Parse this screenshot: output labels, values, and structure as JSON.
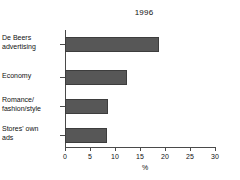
{
  "chart_data": {
    "type": "bar",
    "orientation": "horizontal",
    "title": "1996",
    "xlabel": "%",
    "ylabel": "",
    "xlim": [
      0,
      30
    ],
    "xticks": [
      0,
      5,
      10,
      15,
      20,
      25,
      30
    ],
    "xtick_labels": [
      "0",
      "5",
      "10",
      "15",
      "20",
      "25",
      "30"
    ],
    "grid": false,
    "legend": null,
    "categories": [
      "De Beers\nadvertising",
      "Economy",
      "Romance/\nfashion/style",
      "Stores' own\nads"
    ],
    "values": [
      18.7,
      12.3,
      8.5,
      8.4
    ],
    "series": [
      {
        "name": "1996",
        "values": [
          18.7,
          12.3,
          8.5,
          8.4
        ]
      }
    ],
    "bar_color": "#575757",
    "bar_edge_color": "#3d3d3d",
    "axis_color": "#4a4a4a"
  }
}
